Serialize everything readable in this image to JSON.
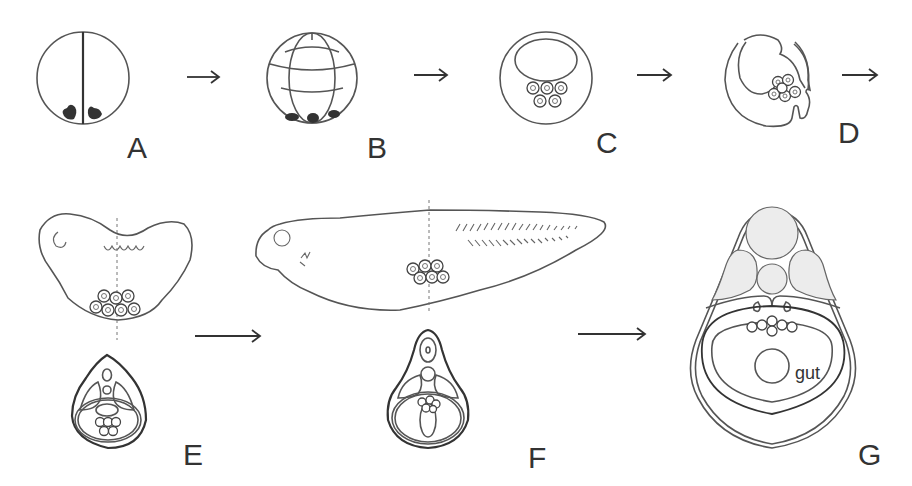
{
  "figure": {
    "stages": [
      {
        "id": "A",
        "label": "A",
        "description": "2-cell egg with vegetal germ plasm"
      },
      {
        "id": "B",
        "label": "B",
        "description": "cleavage-stage embryo with germ plasm at vegetal pole"
      },
      {
        "id": "C",
        "label": "C",
        "description": "blastula with germ cells below blastocoel"
      },
      {
        "id": "D",
        "label": "D",
        "description": "gastrula with germ cells in endoderm"
      },
      {
        "id": "E",
        "label": "E",
        "description": "tailbud embryo with transverse section"
      },
      {
        "id": "F",
        "label": "F",
        "description": "tadpole with transverse section"
      },
      {
        "id": "G",
        "label": "G",
        "description": "cross-section showing germ cells dorsal to gut"
      }
    ],
    "annotations": {
      "gut_label": "gut"
    },
    "arrows": [
      "A-B",
      "B-C",
      "C-D",
      "D-E",
      "E-F",
      "F-G"
    ]
  }
}
